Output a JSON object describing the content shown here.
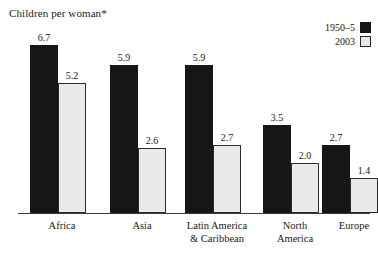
{
  "chart_data": {
    "type": "bar",
    "title": "Children per woman*",
    "xlabel": "",
    "ylabel": "",
    "ylim": [
      0,
      6.7
    ],
    "grid": false,
    "legend_position": "top-right",
    "categories": [
      "Africa",
      "Asia",
      "Latin America & Caribbean",
      "North America",
      "Europe"
    ],
    "category_lines": [
      [
        "Africa"
      ],
      [
        "Asia"
      ],
      [
        "Latin America",
        "& Caribbean"
      ],
      [
        "North",
        "America"
      ],
      [
        "Europe"
      ]
    ],
    "series": [
      {
        "name": "1950–5",
        "color": "#161616",
        "values": [
          6.7,
          5.9,
          5.9,
          3.5,
          2.7
        ],
        "labels": [
          "6.7",
          "5.9",
          "5.9",
          "3.5",
          "2.7"
        ]
      },
      {
        "name": "2003",
        "color": "#e9e9e9",
        "values": [
          5.2,
          2.6,
          2.7,
          2.0,
          1.4
        ],
        "labels": [
          "5.2",
          "2.6",
          "2.7",
          "2.0",
          "1.4"
        ]
      }
    ]
  },
  "legend": {
    "entries": [
      {
        "label": "1950–5",
        "swatch": "dark"
      },
      {
        "label": "2003",
        "swatch": "light"
      }
    ]
  },
  "layout": {
    "groups": [
      {
        "left": 30,
        "label_left": 6,
        "label_width": 112
      },
      {
        "left": 110,
        "label_left": 86,
        "label_width": 112
      },
      {
        "left": 185,
        "label_left": 161,
        "label_width": 112
      },
      {
        "left": 263,
        "label_left": 239,
        "label_width": 112
      },
      {
        "left": 322,
        "label_left": 298,
        "label_width": 112
      }
    ],
    "bar_width": 28,
    "bar_gap": 0,
    "max_bar_px": 168,
    "value_scale_max": 6.7
  }
}
